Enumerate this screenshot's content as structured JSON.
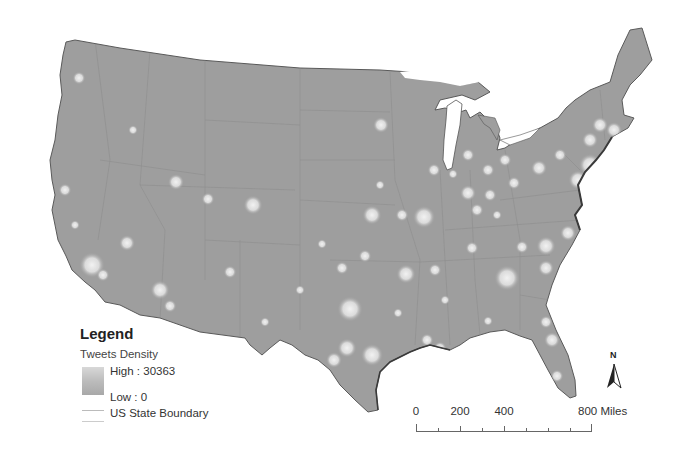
{
  "map": {
    "title": "Tweets Density across the contiguous United States",
    "land_color": "#9e9e9e",
    "hotspot_color": "#e8e8e8",
    "boundary_color": "#8a8a8a",
    "hotspots": [
      {
        "x": 79,
        "y": 78,
        "r": 4
      },
      {
        "x": 133,
        "y": 130,
        "r": 3
      },
      {
        "x": 176,
        "y": 182,
        "r": 5
      },
      {
        "x": 253,
        "y": 205,
        "r": 6
      },
      {
        "x": 208,
        "y": 199,
        "r": 4
      },
      {
        "x": 127,
        "y": 243,
        "r": 5
      },
      {
        "x": 65,
        "y": 190,
        "r": 4
      },
      {
        "x": 75,
        "y": 225,
        "r": 3
      },
      {
        "x": 92,
        "y": 265,
        "r": 8
      },
      {
        "x": 103,
        "y": 275,
        "r": 4
      },
      {
        "x": 160,
        "y": 290,
        "r": 6
      },
      {
        "x": 170,
        "y": 306,
        "r": 4
      },
      {
        "x": 230,
        "y": 272,
        "r": 4
      },
      {
        "x": 381,
        "y": 125,
        "r": 5
      },
      {
        "x": 372,
        "y": 215,
        "r": 6
      },
      {
        "x": 402,
        "y": 215,
        "r": 4
      },
      {
        "x": 424,
        "y": 217,
        "r": 7
      },
      {
        "x": 350,
        "y": 309,
        "r": 8
      },
      {
        "x": 342,
        "y": 268,
        "r": 4
      },
      {
        "x": 365,
        "y": 256,
        "r": 4
      },
      {
        "x": 406,
        "y": 274,
        "r": 6
      },
      {
        "x": 435,
        "y": 270,
        "r": 4
      },
      {
        "x": 347,
        "y": 348,
        "r": 6
      },
      {
        "x": 334,
        "y": 360,
        "r": 5
      },
      {
        "x": 372,
        "y": 355,
        "r": 7
      },
      {
        "x": 427,
        "y": 340,
        "r": 4
      },
      {
        "x": 440,
        "y": 348,
        "r": 4
      },
      {
        "x": 468,
        "y": 193,
        "r": 5
      },
      {
        "x": 490,
        "y": 195,
        "r": 4
      },
      {
        "x": 472,
        "y": 248,
        "r": 4
      },
      {
        "x": 507,
        "y": 278,
        "r": 8
      },
      {
        "x": 522,
        "y": 247,
        "r": 4
      },
      {
        "x": 546,
        "y": 246,
        "r": 6
      },
      {
        "x": 568,
        "y": 233,
        "r": 5
      },
      {
        "x": 546,
        "y": 268,
        "r": 5
      },
      {
        "x": 539,
        "y": 168,
        "r": 5
      },
      {
        "x": 514,
        "y": 183,
        "r": 4
      },
      {
        "x": 488,
        "y": 170,
        "r": 4
      },
      {
        "x": 505,
        "y": 160,
        "r": 4
      },
      {
        "x": 434,
        "y": 170,
        "r": 4
      },
      {
        "x": 453,
        "y": 174,
        "r": 3
      },
      {
        "x": 477,
        "y": 210,
        "r": 4
      },
      {
        "x": 497,
        "y": 215,
        "r": 3
      },
      {
        "x": 546,
        "y": 322,
        "r": 4
      },
      {
        "x": 552,
        "y": 340,
        "r": 5
      },
      {
        "x": 557,
        "y": 376,
        "r": 4
      },
      {
        "x": 590,
        "y": 140,
        "r": 5
      },
      {
        "x": 600,
        "y": 125,
        "r": 5
      },
      {
        "x": 614,
        "y": 130,
        "r": 5
      },
      {
        "x": 590,
        "y": 165,
        "r": 7
      },
      {
        "x": 578,
        "y": 180,
        "r": 6
      },
      {
        "x": 560,
        "y": 155,
        "r": 4
      },
      {
        "x": 468,
        "y": 155,
        "r": 4
      },
      {
        "x": 380,
        "y": 185,
        "r": 3
      },
      {
        "x": 322,
        "y": 244,
        "r": 3
      },
      {
        "x": 445,
        "y": 300,
        "r": 3
      },
      {
        "x": 398,
        "y": 313,
        "r": 3
      },
      {
        "x": 488,
        "y": 321,
        "r": 3
      },
      {
        "x": 265,
        "y": 322,
        "r": 3
      },
      {
        "x": 300,
        "y": 290,
        "r": 3
      }
    ]
  },
  "legend": {
    "title": "Legend",
    "layer_name": "Tweets Density",
    "high_label": "High : 30363",
    "low_label": "Low : 0",
    "boundary_label": "US State Boundary"
  },
  "scale_bar": {
    "labels": [
      {
        "text": "0",
        "pos": 0
      },
      {
        "text": "200",
        "pos": 44
      },
      {
        "text": "400",
        "pos": 88
      },
      {
        "text": "800 Miles",
        "pos": 176
      }
    ],
    "unit": "Miles"
  },
  "north_arrow": {
    "label": "N"
  }
}
